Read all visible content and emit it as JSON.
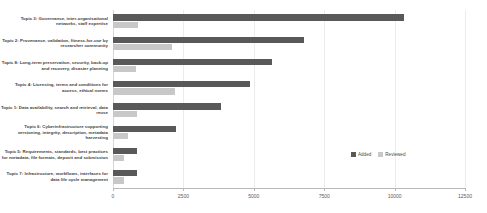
{
  "chart_data": {
    "type": "bar",
    "orientation": "horizontal",
    "title": "",
    "subtitle": "",
    "xlabel": "",
    "ylabel": "",
    "xlim": [
      0,
      12500
    ],
    "xticks": [
      "0",
      "2500",
      "5000",
      "7500",
      "10000",
      "12500"
    ],
    "xtick_values": [
      0,
      2500,
      5000,
      7500,
      10000,
      12500
    ],
    "grid": true,
    "legend_position": "center-right",
    "categories": [
      "Topic 3: Governance, inter-organisational networks, staff expertise",
      "Topic 2: Provenance, validation, fitness-for-use by researcher community",
      "Topic 8: Long-term preservation, security, back-up and recovery, disaster planning",
      "Topic 4: Licensing, terms and conditions for access, ethical norms",
      "Topic 1: Data availability, search and retrieval, data reuse",
      "Topic 6: Cyberinfrastructure supporting versioning, integrity, description, metadata harvesting",
      "Topic 5: Requirements, standards, best practices for metadata, file formats, deposit and submission",
      "Topic 7: Infrastructure, workflows, interfaces for data life cycle management"
    ],
    "series": [
      {
        "name": "Added",
        "color": "#595959",
        "values": [
          10350,
          6800,
          5650,
          4850,
          3850,
          2250,
          850,
          850
        ]
      },
      {
        "name": "Reviewed",
        "color": "#c8c8c8",
        "values": [
          900,
          2100,
          800,
          2200,
          850,
          550,
          400,
          400
        ]
      }
    ]
  },
  "colors": {
    "added": "#595959",
    "reviewed": "#c8c8c8",
    "background": "#ffffff",
    "gridline": "#ececed",
    "axis": "#b9b9bb",
    "label_text": "#3f3f3f",
    "tick_text": "#5a5a5a"
  }
}
